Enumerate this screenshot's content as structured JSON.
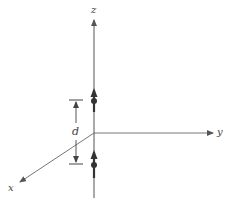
{
  "figure": {
    "axes": {
      "x_label": "x",
      "y_label": "y",
      "z_label": "z"
    },
    "dimension": {
      "label": "d"
    },
    "dipoles": [
      {
        "name": "upper-dipole",
        "orientation": "+z"
      },
      {
        "name": "lower-dipole",
        "orientation": "+z"
      }
    ],
    "colors": {
      "axis": "#555555",
      "dipole": "#333333"
    }
  }
}
